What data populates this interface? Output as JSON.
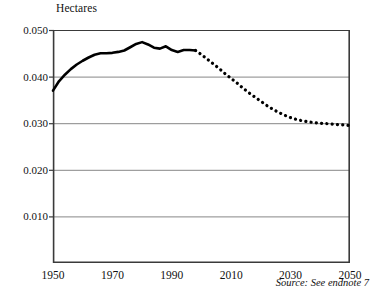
{
  "chart_data": {
    "type": "line",
    "title": "",
    "ylabel": "Hectares",
    "xlabel": "",
    "ylim": [
      0,
      0.05
    ],
    "xlim": [
      1950,
      2050
    ],
    "yticks": [
      "0.010",
      "0.020",
      "0.030",
      "0.040",
      "0.050"
    ],
    "ytick_values": [
      0.01,
      0.02,
      0.03,
      0.04,
      0.05
    ],
    "xticks": [
      "1950",
      "1970",
      "1990",
      "2010",
      "2030",
      "2050"
    ],
    "xtick_values": [
      1950,
      1970,
      1990,
      2010,
      2030,
      2050
    ],
    "grid": "horizontal",
    "legend": "none",
    "annotation": "Source: See endnote 7",
    "series": [
      {
        "name": "Grainland area per person (historical)",
        "style": "solid",
        "color": "#000000",
        "x": [
          1950,
          1952,
          1954,
          1956,
          1958,
          1960,
          1962,
          1964,
          1966,
          1968,
          1970,
          1972,
          1974,
          1976,
          1978,
          1980,
          1982,
          1984,
          1986,
          1988,
          1990,
          1992,
          1994,
          1996,
          1998
        ],
        "values": [
          0.037,
          0.039,
          0.0404,
          0.0416,
          0.0426,
          0.0434,
          0.0441,
          0.0447,
          0.045,
          0.045,
          0.0451,
          0.0453,
          0.0456,
          0.0463,
          0.047,
          0.0474,
          0.0469,
          0.0462,
          0.046,
          0.0465,
          0.0457,
          0.0453,
          0.0457,
          0.0457,
          0.0456
        ]
      },
      {
        "name": "Grainland area per person (projected)",
        "style": "dotted",
        "color": "#000000",
        "x": [
          1998,
          2000,
          2002,
          2004,
          2006,
          2008,
          2010,
          2012,
          2014,
          2016,
          2018,
          2020,
          2022,
          2024,
          2026,
          2028,
          2030,
          2032,
          2034,
          2036,
          2038,
          2040,
          2042,
          2044,
          2046,
          2048,
          2050
        ],
        "values": [
          0.0456,
          0.0447,
          0.0437,
          0.0427,
          0.0417,
          0.0406,
          0.0396,
          0.0386,
          0.0375,
          0.0365,
          0.0356,
          0.0347,
          0.0338,
          0.033,
          0.0323,
          0.0317,
          0.0312,
          0.0308,
          0.0305,
          0.0303,
          0.0301,
          0.03,
          0.0299,
          0.0298,
          0.0297,
          0.0296,
          0.0295
        ]
      }
    ]
  }
}
